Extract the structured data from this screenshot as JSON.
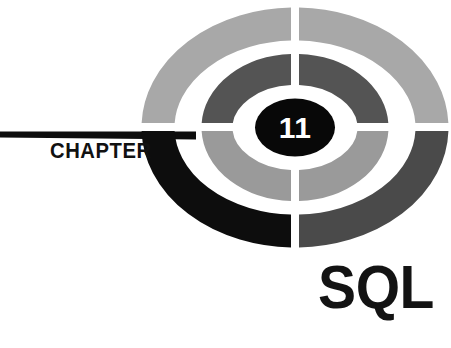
{
  "page": {
    "kind": "book-chapter-opener",
    "background_color": "#ffffff"
  },
  "chapter": {
    "label": "CHAPTER",
    "number": "11",
    "title": "SQL"
  },
  "emblem": {
    "name": "concentric-quadrant-ellipse-logo",
    "outer_ring": {
      "top_left_color": "#a8a8a8",
      "top_right_color": "#a8a8a8",
      "bottom_left_color": "#0d0d0d",
      "bottom_right_color": "#4a4a4a"
    },
    "inner_ring": {
      "top_left_color": "#545454",
      "top_right_color": "#545454",
      "bottom_left_color": "#9a9a9a",
      "bottom_right_color": "#9a9a9a"
    },
    "center_disc_color": "#080808",
    "center_number_color": "#ffffff",
    "gap_color": "#ffffff"
  },
  "rule": {
    "name": "chapter-rule-bar",
    "color": "#0d0d0d"
  }
}
